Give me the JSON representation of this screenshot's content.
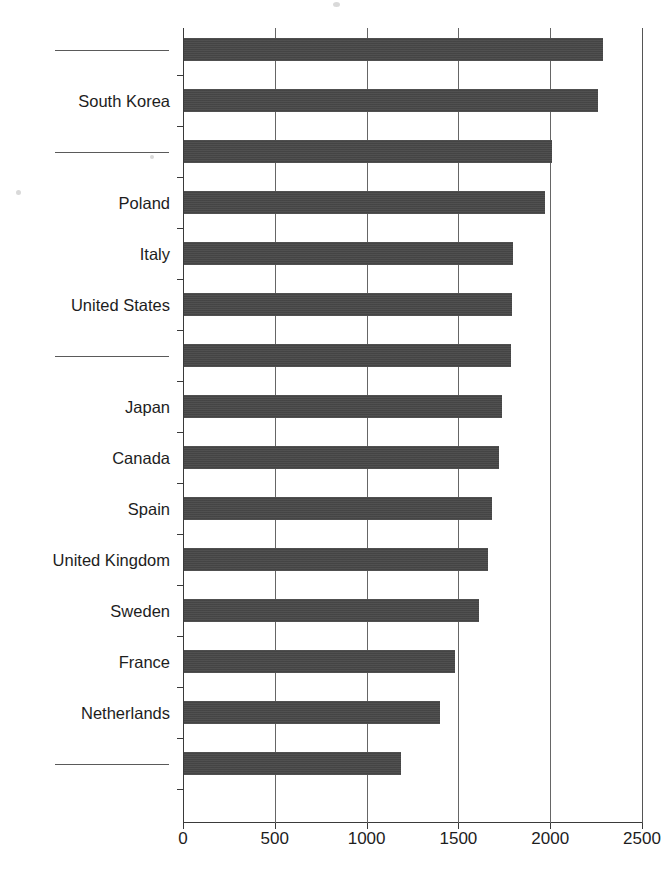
{
  "chart_data": {
    "type": "bar",
    "orientation": "horizontal",
    "title": "",
    "subtitle": "",
    "xlabel": "",
    "ylabel": "",
    "xlim": [
      0,
      2500
    ],
    "xticks": [
      0,
      500,
      1000,
      1500,
      2000,
      2500
    ],
    "xtick_labels": [
      "0",
      "500",
      "1000",
      "1500",
      "2000",
      "2500"
    ],
    "grid": true,
    "grid_axis": "x",
    "legend": false,
    "legend_position": "none",
    "bar_color": "#484848",
    "categories": [
      "",
      "South Korea",
      "",
      "Poland",
      "Italy",
      "United States",
      "",
      "Japan",
      "Canada",
      "Spain",
      "United Kingdom",
      "Sweden",
      "France",
      "Netherlands",
      ""
    ],
    "values": [
      2280,
      2255,
      2005,
      1965,
      1790,
      1785,
      1780,
      1730,
      1715,
      1680,
      1655,
      1605,
      1475,
      1395,
      1180
    ],
    "redacted_categories": [
      0,
      2,
      6,
      14
    ]
  },
  "axis": {
    "x_ticks": [
      {
        "value": 0,
        "label": "0"
      },
      {
        "value": 500,
        "label": "500"
      },
      {
        "value": 1000,
        "label": "1000"
      },
      {
        "value": 1500,
        "label": "1500"
      },
      {
        "value": 2000,
        "label": "2000"
      },
      {
        "value": 2500,
        "label": "2500"
      }
    ]
  },
  "bars": [
    {
      "label": "",
      "value": 2280,
      "redacted": true
    },
    {
      "label": "South Korea",
      "value": 2255,
      "redacted": false
    },
    {
      "label": "",
      "value": 2005,
      "redacted": true
    },
    {
      "label": "Poland",
      "value": 1965,
      "redacted": false
    },
    {
      "label": "Italy",
      "value": 1790,
      "redacted": false
    },
    {
      "label": "United States",
      "value": 1785,
      "redacted": false
    },
    {
      "label": "",
      "value": 1780,
      "redacted": true
    },
    {
      "label": "Japan",
      "value": 1730,
      "redacted": false
    },
    {
      "label": "Canada",
      "value": 1715,
      "redacted": false
    },
    {
      "label": "Spain",
      "value": 1680,
      "redacted": false
    },
    {
      "label": "United Kingdom",
      "value": 1655,
      "redacted": false
    },
    {
      "label": "Sweden",
      "value": 1605,
      "redacted": false
    },
    {
      "label": "France",
      "value": 1475,
      "redacted": false
    },
    {
      "label": "Netherlands",
      "value": 1395,
      "redacted": false
    },
    {
      "label": "",
      "value": 1180,
      "redacted": true
    }
  ]
}
